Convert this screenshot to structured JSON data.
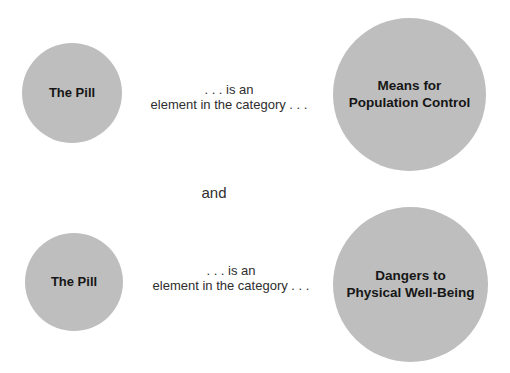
{
  "diagram": {
    "type": "set-membership",
    "statements": [
      {
        "subject": "The Pill",
        "relation": {
          "line1": ". . . is an",
          "line2": "element in the category . . ."
        },
        "category": "Means for\nPopulation Control"
      },
      {
        "subject": "The Pill",
        "relation": {
          "line1": ". . . is an",
          "line2": "element in the category . . ."
        },
        "category": "Dangers to\nPhysical Well-Being"
      }
    ],
    "conjunction": "and"
  },
  "colors": {
    "circle_fill": "#bebebe",
    "label_text": "#161616",
    "body_text": "#2e2e2e",
    "background": "#ffffff"
  }
}
